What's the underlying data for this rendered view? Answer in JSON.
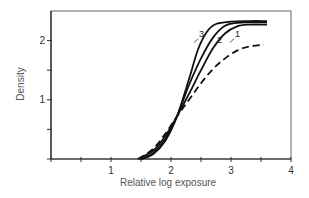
{
  "chart_data": {
    "type": "line",
    "title": "",
    "xlabel": "Relative log exposure",
    "ylabel": "Density",
    "xlim": [
      0,
      4
    ],
    "ylim": [
      0,
      2.5
    ],
    "x_ticks": [
      0,
      0.5,
      1,
      1.5,
      2,
      2.5,
      3,
      3.5,
      4
    ],
    "x_tick_labels": [
      "",
      "",
      "1",
      "",
      "2",
      "",
      "3",
      "",
      "4"
    ],
    "y_ticks": [
      0,
      0.5,
      1,
      1.5,
      2
    ],
    "y_tick_labels": [
      "",
      "",
      "1",
      "",
      "2"
    ],
    "grid": false,
    "legend": "inline labels",
    "series": [
      {
        "name": "3",
        "style": "solid",
        "x": [
          1.5,
          1.7,
          1.9,
          2.1,
          2.3,
          2.45,
          2.6,
          2.75,
          3.0,
          3.3,
          3.6
        ],
        "y": [
          0.0,
          0.08,
          0.3,
          0.72,
          1.35,
          1.85,
          2.15,
          2.28,
          2.32,
          2.33,
          2.33
        ]
      },
      {
        "name": "2",
        "style": "solid",
        "x": [
          1.5,
          1.7,
          1.9,
          2.1,
          2.3,
          2.5,
          2.7,
          2.9,
          3.1,
          3.3,
          3.6
        ],
        "y": [
          0.0,
          0.1,
          0.33,
          0.72,
          1.25,
          1.7,
          2.05,
          2.25,
          2.3,
          2.31,
          2.31
        ]
      },
      {
        "name": "1",
        "style": "solid",
        "x": [
          1.45,
          1.7,
          1.9,
          2.1,
          2.3,
          2.5,
          2.7,
          2.9,
          3.1,
          3.3,
          3.6
        ],
        "y": [
          0.0,
          0.14,
          0.38,
          0.72,
          1.1,
          1.5,
          1.87,
          2.12,
          2.24,
          2.27,
          2.27
        ]
      },
      {
        "name": "unlabeled (dashed)",
        "style": "dashed",
        "x": [
          1.45,
          1.7,
          1.9,
          2.1,
          2.3,
          2.5,
          2.7,
          2.9,
          3.1,
          3.3,
          3.55
        ],
        "y": [
          0.0,
          0.17,
          0.42,
          0.72,
          1.0,
          1.28,
          1.52,
          1.7,
          1.83,
          1.9,
          1.93
        ]
      }
    ],
    "annotations": [
      {
        "text": "3",
        "x": 2.45,
        "y": 2.05
      },
      {
        "text": "2",
        "x": 2.75,
        "y": 1.95
      },
      {
        "text": "1",
        "x": 3.05,
        "y": 2.05
      }
    ]
  }
}
